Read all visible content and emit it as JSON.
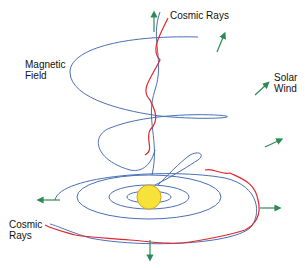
{
  "diagram": {
    "labels": {
      "cosmic_rays_top": "Cosmic Rays",
      "magnetic_field_1": "Magnetic",
      "magnetic_field_2": "Field",
      "solar_wind_1": "Solar",
      "solar_wind_2": "Wind",
      "cosmic_rays_bottom_1": "Cosmic",
      "cosmic_rays_bottom_2": "Rays"
    },
    "colors": {
      "field": "#4a6fb5",
      "rays": "#e0262b",
      "wind": "#2e8b57",
      "sun": "#f7e23a",
      "sun_edge": "#d9a21a"
    }
  }
}
